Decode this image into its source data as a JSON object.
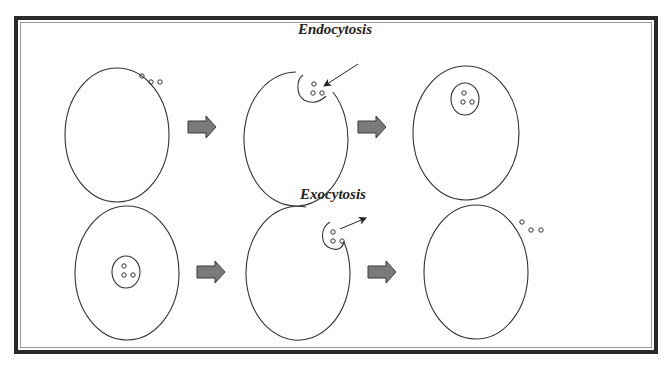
{
  "diagram": {
    "sections": [
      {
        "title": "Endocytosis",
        "steps": [
          {
            "state": "particles outside cell",
            "particles": 3
          },
          {
            "state": "membrane invaginates around particles",
            "particles": 3,
            "arrow": "inward"
          },
          {
            "state": "vesicle inside cell containing particles",
            "particles": 3
          }
        ]
      },
      {
        "title": "Exocytosis",
        "steps": [
          {
            "state": "vesicle inside cell containing particles",
            "particles": 3
          },
          {
            "state": "vesicle fuses with membrane, particles released",
            "particles": 3,
            "arrow": "outward"
          },
          {
            "state": "particles outside cell",
            "particles": 3
          }
        ]
      }
    ],
    "colors": {
      "border": "#2a2a2a",
      "line": "#333333",
      "process_arrow_fill": "#7a7a7a",
      "process_arrow_stroke": "#3a3a3a",
      "background": "#ffffff"
    },
    "icons": {
      "process_arrow": "block-right-arrow",
      "movement_arrow": "thin-pointer-arrow"
    }
  }
}
